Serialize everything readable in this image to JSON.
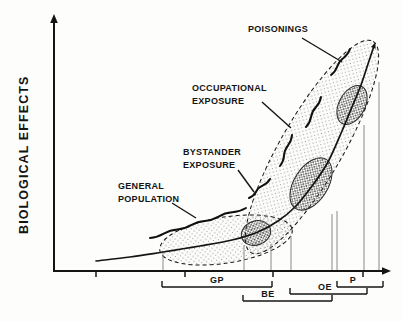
{
  "figure": {
    "background": "#fdfdfb",
    "ink_color": "#141414",
    "drop_line_color": "#8a8a8a",
    "stipple_light_color": "#6b6b6b",
    "stipple_dense_color": "#3d3d3d",
    "labels": {
      "y_axis": "BIOLOGICAL EFFECTS",
      "poisonings": "POISONINGS",
      "occupational_line1": "OCCUPATIONAL",
      "occupational_line2": "EXPOSURE",
      "bystander_line1": "BYSTANDER",
      "bystander_line2": "EXPOSURE",
      "general_line1": "GENERAL",
      "general_line2": "POPULATION",
      "bracket_gp": "GP",
      "bracket_be": "BE",
      "bracket_oe": "OE",
      "bracket_p": "P"
    }
  },
  "chart_data": {
    "type": "line",
    "title": "",
    "xlabel": "",
    "ylabel": "BIOLOGICAL EFFECTS",
    "units": "pixel coordinates of the 403x322 figure; both axes are unscaled (no numeric ticks) in the source",
    "axes": {
      "origin": [
        54,
        271
      ],
      "x_arrow_tip": [
        391,
        271
      ],
      "y_arrow_tip": [
        54,
        14
      ],
      "x_ticks": [
        96,
        185,
        273,
        363
      ],
      "tick_len": 6
    },
    "curve": [
      [
        96,
        261
      ],
      [
        130,
        257
      ],
      [
        163,
        252
      ],
      [
        200,
        246
      ],
      [
        232,
        240
      ],
      [
        258,
        232
      ],
      [
        278,
        221
      ],
      [
        295,
        207
      ],
      [
        312,
        186
      ],
      [
        328,
        162
      ],
      [
        342,
        131
      ],
      [
        352,
        107
      ],
      [
        361,
        85
      ],
      [
        368,
        64
      ],
      [
        374,
        46
      ]
    ],
    "regions": [
      {
        "name": "general-population-envelope",
        "cx": 226,
        "cy": 240,
        "rx": 67,
        "ry": 23,
        "rot": -9
      },
      {
        "name": "exposure-band-envelope",
        "cx": 312,
        "cy": 147,
        "rx": 122,
        "ry": 31,
        "rot": -60
      }
    ],
    "clusters": [
      {
        "name": "bystander-cluster",
        "cx": 256,
        "cy": 233,
        "rx": 15,
        "ry": 12,
        "rot": -20
      },
      {
        "name": "occupational-cluster",
        "cx": 311,
        "cy": 184,
        "rx": 29,
        "ry": 17,
        "rot": -58
      },
      {
        "name": "poisonings-cluster",
        "cx": 352,
        "cy": 105,
        "rx": 21,
        "ry": 13,
        "rot": -62
      }
    ],
    "waves": [
      {
        "name": "general-population-wave",
        "from": [
          150,
          238
        ],
        "to": [
          246,
          208
        ]
      },
      {
        "name": "bystander-wave",
        "from": [
          249,
          198
        ],
        "to": [
          270,
          179
        ]
      },
      {
        "name": "occupational-wave",
        "from": [
          280,
          166
        ],
        "to": [
          292,
          135
        ]
      },
      {
        "name": "mid-wave",
        "from": [
          306,
          127
        ],
        "to": [
          321,
          97
        ]
      },
      {
        "name": "poisonings-wave",
        "from": [
          331,
          75
        ],
        "to": [
          350,
          49
        ]
      }
    ],
    "leaders": [
      {
        "label": "POISONINGS",
        "from": [
          302,
          38
        ],
        "to": [
          342,
          62
        ]
      },
      {
        "label": "OCCUPATIONAL EXPOSURE",
        "from": [
          262,
          102
        ],
        "to": [
          291,
          128
        ]
      },
      {
        "label": "BYSTANDER EXPOSURE",
        "from": [
          238,
          170
        ],
        "to": [
          254,
          192
        ]
      },
      {
        "label": "GENERAL POPULATION",
        "from": [
          172,
          203
        ],
        "to": [
          196,
          218
        ]
      }
    ],
    "drop_lines": [
      [
        163,
        252
      ],
      [
        244,
        245
      ],
      [
        271,
        244
      ],
      [
        291,
        236
      ],
      [
        332,
        214
      ],
      [
        337,
        211
      ],
      [
        364,
        125
      ],
      [
        379,
        82
      ]
    ],
    "drop_line_bottom": 271,
    "brackets": [
      {
        "label": "GP",
        "x1": 162,
        "x2": 272,
        "y": 287
      },
      {
        "label": "BE",
        "x1": 243,
        "x2": 332,
        "y": 301
      },
      {
        "label": "OE",
        "x1": 290,
        "x2": 367,
        "y": 294
      },
      {
        "label": "P",
        "x1": 337,
        "x2": 383,
        "y": 287
      }
    ],
    "legend": "none",
    "grid": false
  }
}
